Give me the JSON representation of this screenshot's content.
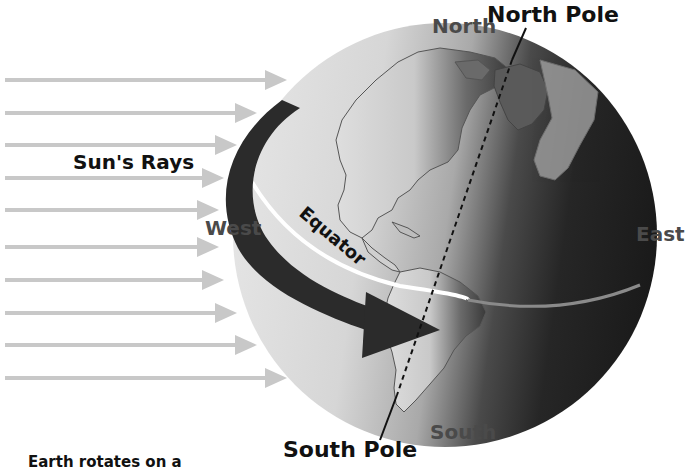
{
  "diagram": {
    "labels": {
      "north_pole": "North Pole",
      "north": "North",
      "suns_rays": "Sun's Rays",
      "west": "West",
      "equator": "Equator",
      "east": "East",
      "south": "South",
      "south_pole": "South Pole",
      "caption": "Earth rotates on a"
    },
    "rays": {
      "count": 10,
      "color": "#c8c8c8",
      "y_positions": [
        80,
        113,
        145,
        178,
        210,
        247,
        280,
        313,
        345,
        378
      ],
      "end_x": [
        285,
        255,
        235,
        222,
        215,
        215,
        222,
        235,
        255,
        285
      ]
    },
    "colors": {
      "globe_lit": "#d9d9d9",
      "globe_dark": "#1e1e1e",
      "rotation_arrow": "#2b2b2b",
      "equator_line": "#ffffff",
      "land_outline": "#555555",
      "text_dark": "#111111",
      "text_gray": "#4a4a4a"
    }
  }
}
